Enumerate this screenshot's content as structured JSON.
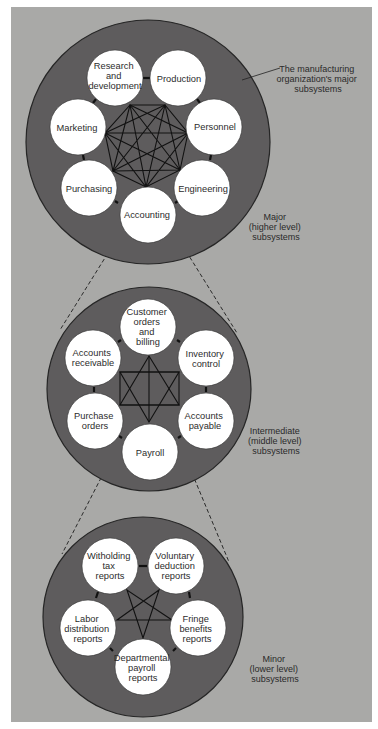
{
  "colors": {
    "page_bg": "#ffffff",
    "panel_bg": "#a9a9a7",
    "system_circle_fill": "#5e5c5d",
    "system_circle_stroke": "#262626",
    "node_fill": "#ffffff",
    "link_stroke": "#111111",
    "text": "#2c2c2c"
  },
  "levels": [
    {
      "id": "major",
      "label_lines": [
        "Major",
        "(higher level)",
        "subsystems"
      ],
      "callout_lines": [
        "The manufacturing",
        "organization's major",
        "subsystems"
      ],
      "nodes": [
        {
          "id": "rd",
          "lines": [
            "Research",
            "and",
            "development"
          ]
        },
        {
          "id": "production",
          "lines": [
            "Production"
          ]
        },
        {
          "id": "personnel",
          "lines": [
            "Personnel"
          ]
        },
        {
          "id": "engineering",
          "lines": [
            "Engineering"
          ]
        },
        {
          "id": "accounting",
          "lines": [
            "Accounting"
          ]
        },
        {
          "id": "purchasing",
          "lines": [
            "Purchasing"
          ]
        },
        {
          "id": "marketing",
          "lines": [
            "Marketing"
          ]
        }
      ],
      "expanded_node": "accounting"
    },
    {
      "id": "intermediate",
      "label_lines": [
        "Intermediate",
        "(middle level)",
        "subsystems"
      ],
      "nodes": [
        {
          "id": "customer_orders",
          "lines": [
            "Customer",
            "orders",
            "and",
            "billing"
          ]
        },
        {
          "id": "inventory",
          "lines": [
            "Inventory",
            "control"
          ]
        },
        {
          "id": "accounts_payable",
          "lines": [
            "Accounts",
            "payable"
          ]
        },
        {
          "id": "payroll",
          "lines": [
            "Payroll"
          ]
        },
        {
          "id": "purchase_orders",
          "lines": [
            "Purchase",
            "orders"
          ]
        },
        {
          "id": "accounts_receivable",
          "lines": [
            "Accounts",
            "receivable"
          ]
        }
      ],
      "expanded_node": "payroll"
    },
    {
      "id": "minor",
      "label_lines": [
        "Minor",
        "(lower level)",
        "subsystems"
      ],
      "nodes": [
        {
          "id": "withholding",
          "lines": [
            "Witholding",
            "tax",
            "reports"
          ]
        },
        {
          "id": "voluntary",
          "lines": [
            "Voluntary",
            "deduction",
            "reports"
          ]
        },
        {
          "id": "fringe",
          "lines": [
            "Fringe",
            "benefits",
            "reports"
          ]
        },
        {
          "id": "departmental",
          "lines": [
            "Departmental",
            "payroll",
            "reports"
          ]
        },
        {
          "id": "labor",
          "lines": [
            "Labor",
            "distribution",
            "reports"
          ]
        }
      ]
    }
  ]
}
